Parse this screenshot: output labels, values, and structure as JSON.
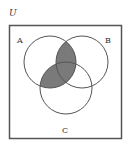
{
  "diagram": {
    "type": "venn-3",
    "universe_label": "U",
    "sets": [
      {
        "label": "A",
        "cx": 50,
        "cy": 62,
        "r": 26
      },
      {
        "label": "B",
        "cx": 82,
        "cy": 62,
        "r": 26
      },
      {
        "label": "C",
        "cx": 66,
        "cy": 88,
        "r": 26
      }
    ],
    "shaded_region": "A ∩ (B ∪ C)",
    "colors": {
      "stroke": "#555555",
      "shade": "#7a7a7a",
      "background": "#ffffff"
    }
  }
}
